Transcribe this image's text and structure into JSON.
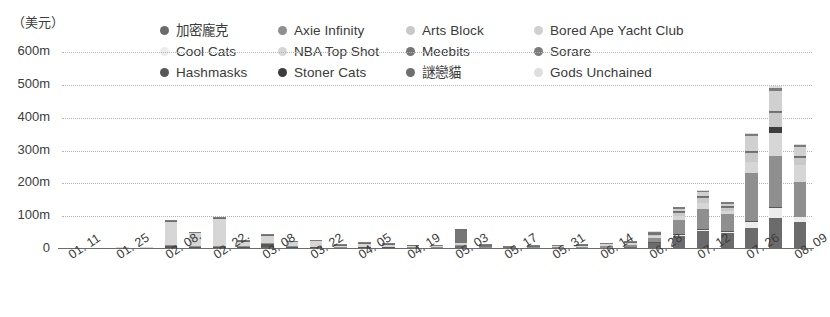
{
  "unit_label": "（美元）",
  "legend": {
    "items": [
      {
        "label": "加密龐克",
        "color": "#6b6b6b"
      },
      {
        "label": "Cool Cats",
        "color": "#ececec"
      },
      {
        "label": "Hashmasks",
        "color": "#585858"
      },
      {
        "label": "Axie Infinity",
        "color": "#8f8f8f"
      },
      {
        "label": "NBA Top Shot",
        "color": "#d6d6d6"
      },
      {
        "label": "Stoner Cats",
        "color": "#3d3d3d"
      },
      {
        "label": "Arts Block",
        "color": "#c9c9c9"
      },
      {
        "label": "Meebits",
        "color": "#757575"
      },
      {
        "label": "謎戀貓",
        "color": "#6e6e6e"
      },
      {
        "label": "Bored Ape Yacht Club",
        "color": "#d0d0d0"
      },
      {
        "label": "Sorare",
        "color": "#7c7c7c"
      },
      {
        "label": "Gods Unchained",
        "color": "#dedede"
      }
    ]
  },
  "yaxis": {
    "ticks": [
      "0",
      "100m",
      "200m",
      "300m",
      "400m",
      "500m",
      "600m"
    ]
  },
  "chart_data": {
    "type": "bar",
    "title": "",
    "subtitle": "",
    "xlabel": "",
    "ylabel": "（美元）",
    "ylim": [
      0,
      600
    ],
    "ytick_values": [
      0,
      100,
      200,
      300,
      400,
      500,
      600
    ],
    "ytick_labels": [
      "0",
      "100m",
      "200m",
      "300m",
      "400m",
      "500m",
      "600m"
    ],
    "grid": true,
    "stacked": true,
    "legend_position": "top",
    "legend_entries": [
      "加密龐克",
      "Cool Cats",
      "Hashmasks",
      "Axie Infinity",
      "NBA Top Shot",
      "Stoner Cats",
      "Arts Block",
      "Meebits",
      "謎戀貓",
      "Bored Ape Yacht Club",
      "Sorare",
      "Gods Unchained"
    ],
    "categories": [
      "01. 11",
      "01. 18",
      "01. 25",
      "02. 01",
      "02. 08.",
      "02. 15",
      "02. 22.",
      "03. 01",
      "03. 08",
      "03. 15",
      "03. 22",
      "03. 29",
      "04. 05",
      "04. 12",
      "04. 19",
      "04. 26",
      "05. 03",
      "05. 10",
      "05. 17",
      "05. 24",
      "05. 31",
      "06. 07",
      "06. 14",
      "06. 21",
      "06. 28",
      "07. 05",
      "07. 12",
      "07. 19",
      "07. 26",
      "08. 02",
      "08. 09"
    ],
    "xtick_labels": [
      "01. 11",
      "01. 25",
      "02. 08.",
      "02. 22.",
      "03. 08",
      "03. 22",
      "04. 05",
      "04. 19",
      "05. 03",
      "05. 17",
      "05. 31",
      "06. 14",
      "06. 28",
      "07. 12",
      "07. 26",
      "08. 09"
    ],
    "xtick_indices": [
      0,
      2,
      4,
      6,
      8,
      10,
      12,
      14,
      16,
      18,
      20,
      22,
      24,
      26,
      28,
      30
    ],
    "series": [
      {
        "name": "加密龐克",
        "color": "#6b6b6b",
        "values": [
          0,
          0,
          1,
          1,
          2,
          1,
          2,
          3,
          5,
          3,
          2,
          1,
          2,
          2,
          1,
          1,
          8,
          1,
          0,
          1,
          2,
          3,
          4,
          6,
          18,
          40,
          55,
          48,
          65,
          95,
          82
        ]
      },
      {
        "name": "Cool Cats",
        "color": "#ececec",
        "values": [
          0,
          0,
          0,
          0,
          0,
          0,
          0,
          0,
          0,
          0,
          0,
          0,
          0,
          0,
          0,
          0,
          0,
          0,
          0,
          0,
          0,
          0,
          0,
          0,
          0,
          2,
          4,
          3,
          18,
          30,
          14
        ]
      },
      {
        "name": "Hashmasks",
        "color": "#585858",
        "values": [
          0,
          0,
          0,
          0,
          6,
          3,
          4,
          2,
          10,
          2,
          1,
          0,
          1,
          1,
          0,
          0,
          2,
          0,
          0,
          0,
          0,
          0,
          0,
          0,
          1,
          2,
          2,
          2,
          3,
          4,
          3
        ]
      },
      {
        "name": "Axie Infinity",
        "color": "#8f8f8f",
        "values": [
          0,
          0,
          0,
          0,
          3,
          2,
          3,
          2,
          3,
          2,
          2,
          1,
          2,
          2,
          1,
          1,
          3,
          1,
          0,
          1,
          2,
          3,
          5,
          7,
          14,
          45,
          60,
          52,
          145,
          155,
          105
        ]
      },
      {
        "name": "NBA Top Shot",
        "color": "#d6d6d6",
        "values": [
          0,
          0,
          1,
          2,
          72,
          40,
          82,
          14,
          22,
          12,
          16,
          5,
          8,
          6,
          4,
          3,
          4,
          2,
          1,
          2,
          3,
          4,
          5,
          4,
          5,
          12,
          20,
          10,
          35,
          70,
          52
        ]
      },
      {
        "name": "Stoner Cats",
        "color": "#3d3d3d",
        "values": [
          0,
          0,
          0,
          0,
          0,
          0,
          0,
          0,
          0,
          0,
          0,
          0,
          0,
          0,
          0,
          0,
          0,
          0,
          0,
          0,
          0,
          0,
          0,
          0,
          0,
          0,
          0,
          0,
          0,
          18,
          0
        ]
      },
      {
        "name": "Arts Block",
        "color": "#c9c9c9",
        "values": [
          0,
          0,
          0,
          0,
          0,
          0,
          0,
          0,
          0,
          0,
          0,
          0,
          0,
          0,
          0,
          0,
          0,
          0,
          0,
          0,
          0,
          0,
          0,
          1,
          3,
          8,
          14,
          10,
          28,
          42,
          22
        ]
      },
      {
        "name": "Meebits",
        "color": "#757575",
        "values": [
          0,
          0,
          0,
          0,
          0,
          0,
          0,
          0,
          0,
          0,
          0,
          0,
          0,
          0,
          0,
          0,
          40,
          3,
          1,
          0,
          0,
          0,
          0,
          0,
          1,
          2,
          2,
          1,
          2,
          3,
          2
        ]
      },
      {
        "name": "謎戀貓",
        "color": "#6e6e6e",
        "values": [
          1,
          1,
          1,
          1,
          2,
          1,
          2,
          1,
          2,
          1,
          1,
          1,
          1,
          1,
          1,
          1,
          2,
          1,
          1,
          1,
          1,
          1,
          1,
          1,
          2,
          2,
          2,
          2,
          3,
          3,
          3
        ]
      },
      {
        "name": "Bored Ape Yacht Club",
        "color": "#d0d0d0",
        "values": [
          0,
          0,
          0,
          0,
          0,
          0,
          0,
          0,
          0,
          0,
          0,
          0,
          0,
          0,
          0,
          0,
          0,
          0,
          0,
          0,
          0,
          0,
          0,
          0,
          2,
          8,
          12,
          8,
          45,
          62,
          28
        ]
      },
      {
        "name": "Sorare",
        "color": "#7c7c7c",
        "values": [
          0,
          0,
          0,
          0,
          1,
          1,
          1,
          1,
          1,
          1,
          1,
          1,
          1,
          1,
          1,
          1,
          2,
          1,
          1,
          1,
          1,
          1,
          2,
          2,
          3,
          4,
          5,
          4,
          6,
          8,
          5
        ]
      },
      {
        "name": "Gods Unchained",
        "color": "#dedede",
        "values": [
          0,
          0,
          0,
          0,
          0,
          0,
          0,
          0,
          0,
          0,
          0,
          0,
          0,
          0,
          0,
          0,
          0,
          0,
          0,
          0,
          0,
          0,
          0,
          0,
          1,
          2,
          3,
          2,
          4,
          6,
          4
        ]
      }
    ],
    "totals": [
      1,
      1,
      3,
      4,
      86,
      48,
      94,
      23,
      43,
      21,
      23,
      9,
      15,
      13,
      8,
      6,
      61,
      9,
      4,
      6,
      9,
      12,
      17,
      21,
      50,
      127,
      179,
      142,
      354,
      496,
      320
    ]
  }
}
